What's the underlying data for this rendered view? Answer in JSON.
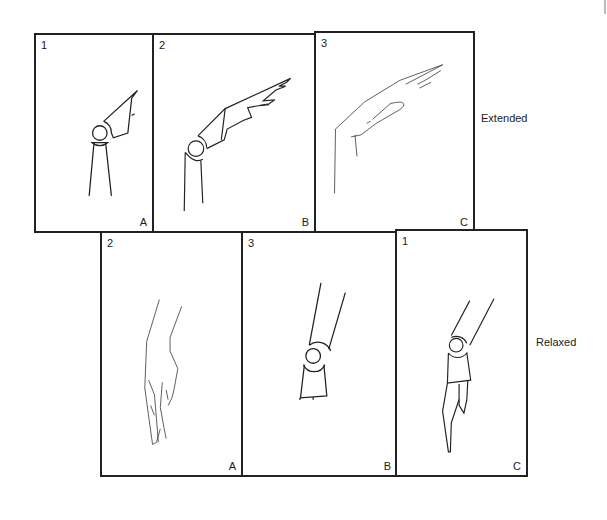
{
  "figure": {
    "rows": [
      {
        "label": "Extended",
        "panels": [
          {
            "number": "1",
            "letter": "A",
            "style": "skeletal-schematic"
          },
          {
            "number": "2",
            "letter": "B",
            "style": "semi-schematic-hand"
          },
          {
            "number": "3",
            "letter": "C",
            "style": "freehand-hand"
          }
        ]
      },
      {
        "label": "Relaxed",
        "panels": [
          {
            "number": "2",
            "letter": "A",
            "style": "freehand-hand"
          },
          {
            "number": "3",
            "letter": "B",
            "style": "skeletal-schematic"
          },
          {
            "number": "1",
            "letter": "C",
            "style": "semi-schematic-hand"
          }
        ]
      }
    ]
  },
  "colors": {
    "stroke": "#222222",
    "background": "#ffffff"
  }
}
